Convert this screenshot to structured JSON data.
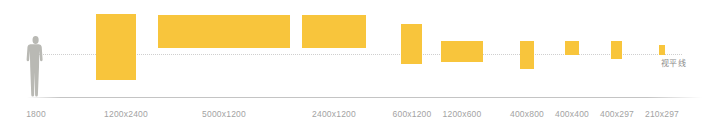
{
  "chart_data": {
    "type": "bar",
    "title": "",
    "subtitle": "",
    "xlabel": "",
    "ylabel": "",
    "grid": false,
    "legend_position": "none",
    "baseline_label": "视平线",
    "baseline_label_meaning": "eye-level line",
    "bar_color": "#F8C53C",
    "ground_line_color": "#C4C4C4",
    "eye_line_color": "#CFCFCF",
    "label_color": "#A3A3A3",
    "figure_color": "#B9B9B4",
    "categories": [
      "1800",
      "1200x2400",
      "5000x1200",
      "2400x1200",
      "600x1200",
      "1200x600",
      "400x800",
      "400x400",
      "400x297",
      "210x297"
    ],
    "items": [
      {
        "label": "1800",
        "kind": "human-figure",
        "width_mm": null,
        "height_mm": 1800,
        "x": 36,
        "left": 26,
        "top": 35,
        "w": 20,
        "h": 62
      },
      {
        "label": "1200x2400",
        "kind": "panel",
        "width_mm": 1200,
        "height_mm": 2400,
        "x": 126,
        "left": 96,
        "top": 14,
        "w": 40,
        "h": 66
      },
      {
        "label": "5000x1200",
        "kind": "panel",
        "width_mm": 5000,
        "height_mm": 1200,
        "x": 224,
        "left": 158,
        "top": 15,
        "w": 132,
        "h": 33
      },
      {
        "label": "2400x1200",
        "kind": "panel",
        "width_mm": 2400,
        "height_mm": 1200,
        "x": 334,
        "left": 302,
        "top": 15,
        "w": 64,
        "h": 33
      },
      {
        "label": "600x1200",
        "kind": "panel",
        "width_mm": 600,
        "height_mm": 1200,
        "x": 412,
        "left": 401,
        "top": 24,
        "w": 21,
        "h": 40
      },
      {
        "label": "1200x600",
        "kind": "panel",
        "width_mm": 1200,
        "height_mm": 600,
        "x": 462,
        "left": 441,
        "top": 41,
        "w": 42,
        "h": 21
      },
      {
        "label": "400x800",
        "kind": "panel",
        "width_mm": 400,
        "height_mm": 800,
        "x": 527,
        "left": 520,
        "top": 41,
        "w": 14,
        "h": 28
      },
      {
        "label": "400x400",
        "kind": "panel",
        "width_mm": 400,
        "height_mm": 400,
        "x": 572,
        "left": 565,
        "top": 41,
        "w": 14,
        "h": 14
      },
      {
        "label": "400x297",
        "kind": "panel",
        "width_mm": 400,
        "height_mm": 297,
        "x": 617,
        "left": 611,
        "top": 41,
        "w": 11,
        "h": 18
      },
      {
        "label": "210x297",
        "kind": "panel",
        "width_mm": 210,
        "height_mm": 297,
        "x": 662,
        "left": 659,
        "top": 45,
        "w": 6,
        "h": 10
      }
    ]
  }
}
